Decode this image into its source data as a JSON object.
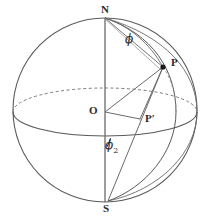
{
  "figure": {
    "type": "geometry-diagram",
    "background_color": "#ffffff",
    "stroke_color": "#5a5a5a",
    "label_color": "#2b2b2b",
    "width": 209,
    "height": 220
  },
  "labels": {
    "north_pole": "N",
    "south_pole": "S",
    "origin": "O",
    "point_p": "P",
    "point_p_prime": "P′",
    "angle_phi": "ϕ",
    "angle_phi_half_numerator": "ϕ",
    "angle_phi_half_denominator": "2"
  },
  "geometry": {
    "sphere": {
      "center_x": 105,
      "center_y": 110,
      "radius": 92
    },
    "equator": {
      "center_x": 105,
      "center_y": 112,
      "rx": 92,
      "ry": 24,
      "front_style": "solid",
      "back_style": "dashed"
    },
    "axis": {
      "from": "N",
      "to": "S",
      "x": 105,
      "y_top": 18,
      "y_bottom": 202
    },
    "points": {
      "N": {
        "x": 105,
        "y": 18
      },
      "S": {
        "x": 108,
        "y": 201
      },
      "O": {
        "x": 105,
        "y": 112
      },
      "P": {
        "x": 163,
        "y": 67
      },
      "P_prime": {
        "x": 140,
        "y": 119
      }
    },
    "segments": [
      {
        "name": "chord-N-to-P",
        "from": "N",
        "to": "P"
      },
      {
        "name": "radius-O-to-P",
        "from": "O",
        "to": "P"
      },
      {
        "name": "radius-O-to-P-prime",
        "from": "O",
        "to": "P_prime"
      },
      {
        "name": "drop-P-to-P-prime",
        "from": "P",
        "to": "P_prime"
      },
      {
        "name": "chord-S-to-P",
        "from": "S",
        "to": "P"
      }
    ],
    "arcs": [
      {
        "name": "meridian-through-P",
        "from": "N",
        "to": "S",
        "bulge": "right"
      },
      {
        "name": "meridian-outer-right",
        "from": "N",
        "to": "S",
        "bulge": "right-wide"
      },
      {
        "name": "arc-N-to-P",
        "from": "N",
        "to": "P",
        "style": "curved"
      }
    ]
  }
}
